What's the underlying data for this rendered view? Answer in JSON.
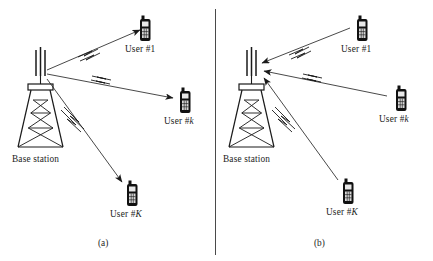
{
  "figure": {
    "stroke_color": "#1a1a1a",
    "phone_body_color": "#111111",
    "background": "#ffffff"
  },
  "panels": [
    {
      "id": "a",
      "caption": "(a)",
      "direction": "downlink",
      "base_station": {
        "label": "Base station",
        "icon": "cell-tower-icon"
      },
      "users": [
        {
          "id": "user-1",
          "label_prefix": "User #",
          "label_suffix": "1",
          "italic_suffix": false,
          "icon": "mobile-phone-icon"
        },
        {
          "id": "user-k",
          "label_prefix": "User #",
          "label_suffix": "k",
          "italic_suffix": true,
          "icon": "mobile-phone-icon"
        },
        {
          "id": "user-K",
          "label_prefix": "User #",
          "label_suffix": "K",
          "italic_suffix": true,
          "icon": "mobile-phone-icon"
        }
      ]
    },
    {
      "id": "b",
      "caption": "(b)",
      "direction": "uplink",
      "base_station": {
        "label": "Base station",
        "icon": "cell-tower-icon"
      },
      "users": [
        {
          "id": "user-1",
          "label_prefix": "User #",
          "label_suffix": "1",
          "italic_suffix": false,
          "icon": "mobile-phone-icon"
        },
        {
          "id": "user-k",
          "label_prefix": "User #",
          "label_suffix": "k",
          "italic_suffix": true,
          "icon": "mobile-phone-icon"
        },
        {
          "id": "user-K",
          "label_prefix": "User #",
          "label_suffix": "K",
          "italic_suffix": true,
          "icon": "mobile-phone-icon"
        }
      ]
    }
  ]
}
